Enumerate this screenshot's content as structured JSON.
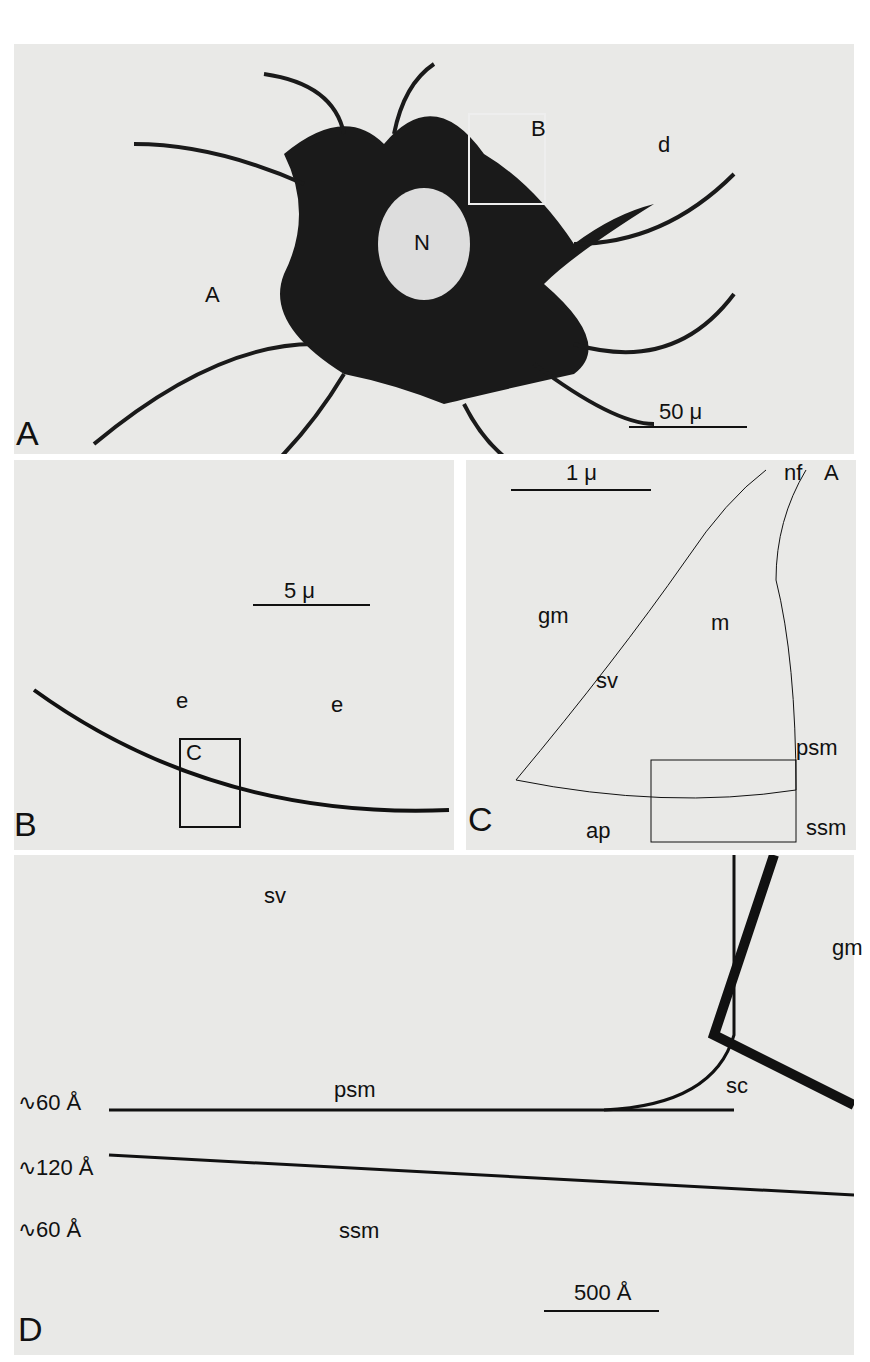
{
  "panels": {
    "A": {
      "letter": "A",
      "labels": {
        "box": "B",
        "dendrite": "d",
        "nucleus": "N",
        "axon": "A"
      },
      "scale": "50 μ"
    },
    "B": {
      "letter": "B",
      "labels": {
        "e1": "e",
        "e2": "e",
        "box": "C"
      },
      "scale": "5 μ"
    },
    "C": {
      "letter": "C",
      "labels": {
        "axon": "A",
        "nf": "nf",
        "gm": "gm",
        "m": "m",
        "sv": "sv",
        "psm": "psm",
        "ap": "ap",
        "ssm": "ssm",
        "box": "D"
      },
      "scale": "1 μ"
    },
    "D": {
      "letter": "D",
      "labels": {
        "sv": "sv",
        "gm": "gm",
        "psm": "psm",
        "sc": "sc",
        "ssm": "ssm",
        "d1": "∿60 Å",
        "d2": "∿120 Å",
        "d3": "∿60 Å"
      },
      "scale": "500 Å"
    }
  }
}
